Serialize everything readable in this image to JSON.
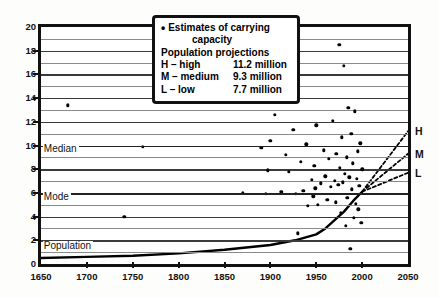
{
  "legend": {
    "bullet": "•",
    "line1a": "Estimates of carrying",
    "line1b": "capacity",
    "line2": "Population projections",
    "rows": [
      {
        "key": "H – high",
        "value": "11.2 million"
      },
      {
        "key": "M – medium",
        "value": "9.3 million"
      },
      {
        "key": "L – low",
        "value": "7.7 million"
      }
    ]
  },
  "inline_labels": {
    "median": "Median",
    "mode": "Mode",
    "population": "Population"
  },
  "right_labels": {
    "high": "H",
    "medium": "M",
    "low": "L"
  },
  "chart_data": {
    "type": "scatter",
    "title": "",
    "xlabel": "",
    "ylabel": "",
    "xlim": [
      1650,
      2050
    ],
    "ylim": [
      0,
      20
    ],
    "xticks": [
      1650,
      1700,
      1750,
      1800,
      1850,
      1900,
      1950,
      2000,
      2050
    ],
    "yticks": [
      0,
      2,
      4,
      6,
      8,
      10,
      12,
      14,
      16,
      18,
      20
    ],
    "grid": "horizontal gridlines every 1 unit",
    "legend_position": "top-center",
    "series": [
      {
        "name": "Estimates of carrying capacity",
        "type": "scatter",
        "points": [
          [
            1679,
            13.4
          ],
          [
            1741,
            4.0
          ],
          [
            1761,
            9.9
          ],
          [
            1870,
            6.0
          ],
          [
            1890,
            9.8
          ],
          [
            1895,
            5.9
          ],
          [
            1897,
            7.9
          ],
          [
            1900,
            10.4
          ],
          [
            1905,
            12.6
          ],
          [
            1912,
            6.1
          ],
          [
            1917,
            9.2
          ],
          [
            1920,
            7.8
          ],
          [
            1925,
            11.3
          ],
          [
            1928,
            5.9
          ],
          [
            1930,
            2.6
          ],
          [
            1933,
            8.6
          ],
          [
            1936,
            6.2
          ],
          [
            1939,
            10.1
          ],
          [
            1941,
            4.9
          ],
          [
            1945,
            7.1
          ],
          [
            1947,
            5.7
          ],
          [
            1948,
            8.3
          ],
          [
            1949,
            6.4
          ],
          [
            1950,
            11.7
          ],
          [
            1952,
            5.0
          ],
          [
            1955,
            6.8
          ],
          [
            1958,
            9.6
          ],
          [
            1960,
            7.4
          ],
          [
            1962,
            5.4
          ],
          [
            1964,
            8.9
          ],
          [
            1966,
            6.5
          ],
          [
            1968,
            12.1
          ],
          [
            1970,
            7.0
          ],
          [
            1971,
            5.2
          ],
          [
            1972,
            9.3
          ],
          [
            1974,
            6.7
          ],
          [
            1975,
            18.5
          ],
          [
            1976,
            8.1
          ],
          [
            1977,
            4.3
          ],
          [
            1978,
            10.7
          ],
          [
            1979,
            6.9
          ],
          [
            1980,
            16.7
          ],
          [
            1981,
            7.6
          ],
          [
            1982,
            3.2
          ],
          [
            1983,
            9.0
          ],
          [
            1984,
            5.6
          ],
          [
            1985,
            13.2
          ],
          [
            1986,
            7.3
          ],
          [
            1987,
            1.3
          ],
          [
            1988,
            11.0
          ],
          [
            1989,
            6.3
          ],
          [
            1990,
            8.5
          ],
          [
            1991,
            3.9
          ],
          [
            1992,
            12.9
          ],
          [
            1993,
            5.1
          ],
          [
            1994,
            7.2
          ],
          [
            1995,
            9.5
          ],
          [
            1996,
            4.6
          ],
          [
            1997,
            6.6
          ],
          [
            1998,
            10.2
          ],
          [
            1999,
            3.5
          ],
          [
            2000,
            8.0
          ]
        ]
      },
      {
        "name": "Population",
        "type": "line",
        "points": [
          [
            1650,
            0.5
          ],
          [
            1700,
            0.6
          ],
          [
            1750,
            0.7
          ],
          [
            1800,
            0.9
          ],
          [
            1850,
            1.2
          ],
          [
            1900,
            1.6
          ],
          [
            1927,
            2.0
          ],
          [
            1950,
            2.5
          ],
          [
            1960,
            3.0
          ],
          [
            1970,
            3.7
          ],
          [
            1980,
            4.4
          ],
          [
            1990,
            5.3
          ],
          [
            2000,
            6.1
          ]
        ]
      },
      {
        "name": "H – high projection",
        "type": "line-dashed",
        "points": [
          [
            2000,
            6.1
          ],
          [
            2050,
            11.2
          ]
        ]
      },
      {
        "name": "M – medium projection",
        "type": "line-dashed",
        "points": [
          [
            2000,
            6.1
          ],
          [
            2050,
            9.3
          ]
        ]
      },
      {
        "name": "L – low projection",
        "type": "line-dashed",
        "points": [
          [
            2000,
            6.1
          ],
          [
            2050,
            7.7
          ]
        ]
      }
    ],
    "reference_lines": [
      {
        "label": "Median",
        "y": 10.0
      },
      {
        "label": "Mode",
        "y": 6.0
      }
    ]
  },
  "colors": {
    "axis": "#111111",
    "grid": "#8a8a8a",
    "data": "#000000",
    "background": "#ffffff"
  }
}
